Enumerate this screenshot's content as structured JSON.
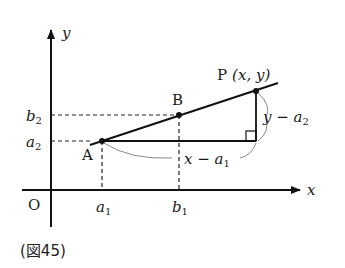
{
  "figure": {
    "caption": "(図45)",
    "axes": {
      "x_label": "x",
      "y_label": "y",
      "origin_label": "O"
    },
    "points": {
      "A": {
        "label": "A"
      },
      "B": {
        "label": "B"
      },
      "P": {
        "label": "P",
        "coords": "(x, y)"
      }
    },
    "ticks": {
      "x": [
        {
          "base": "a",
          "sub": "1"
        },
        {
          "base": "b",
          "sub": "1"
        }
      ],
      "y": [
        {
          "base": "b",
          "sub": "2"
        },
        {
          "base": "a",
          "sub": "2"
        }
      ]
    },
    "annotations": {
      "horizontal": {
        "var": "x",
        "op": " − ",
        "base": "a",
        "sub": "1"
      },
      "vertical": {
        "var": "y",
        "op": " − ",
        "base": "a",
        "sub": "2"
      }
    },
    "colors": {
      "line": "#111111",
      "brace": "#888888"
    }
  }
}
